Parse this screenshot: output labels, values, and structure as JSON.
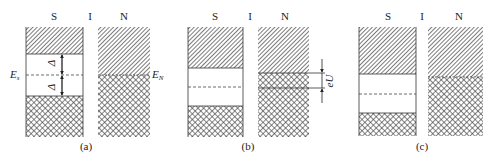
{
  "layer_labels": {
    "s": "S",
    "i": "I",
    "n": "N"
  },
  "panels": [
    {
      "caption": "(a)",
      "annotations": {
        "fermi_s": "E",
        "fermi_s_sub": "s",
        "fermi_n": "E",
        "fermi_n_sub": "N",
        "gap_upper": "Δ",
        "gap_lower": "Δ"
      }
    },
    {
      "caption": "(b)",
      "annotations": {
        "bias": "eU"
      }
    },
    {
      "caption": "(c)",
      "annotations": {}
    }
  ],
  "legend": {
    "hatched": "empty states",
    "crosshatched": "occupied states"
  },
  "colors": {
    "line": "#333333",
    "fill": "#555555",
    "background": "#ffffff"
  }
}
